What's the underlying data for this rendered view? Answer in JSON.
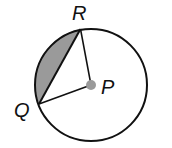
{
  "diagram": {
    "type": "circle-segment",
    "center_label": "P",
    "points": [
      {
        "label": "R",
        "position": "top"
      },
      {
        "label": "Q",
        "position": "left"
      }
    ],
    "shaded_region": "minor segment between chord QR and arc QR",
    "colors": {
      "stroke": "#111111",
      "shade": "#9a9a9a",
      "center_dot": "#9a9a9a"
    }
  }
}
